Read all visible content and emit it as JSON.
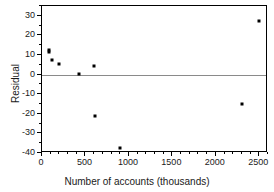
{
  "chart_data": {
    "type": "scatter",
    "title": "",
    "xlabel": "Number of accounts (thousands)",
    "ylabel": "Residual",
    "xlim": [
      0,
      2600
    ],
    "ylim": [
      -40,
      35
    ],
    "grid": false,
    "legend": "none",
    "reference_line": {
      "axis": "y",
      "value": 0
    },
    "xticks": [
      0,
      500,
      1000,
      1500,
      2000,
      2500
    ],
    "xticklabels": [
      "0",
      "500",
      "1000",
      "1500",
      "2000",
      "2500"
    ],
    "yticks": [
      30,
      20,
      10,
      0,
      -10,
      -20,
      -30,
      -40
    ],
    "yticklabels": [
      "30",
      "20",
      "10",
      "0",
      "-10",
      "-20",
      "-30",
      "-40"
    ],
    "points": [
      {
        "x": 80,
        "y": 12.5
      },
      {
        "x": 85,
        "y": 11.5
      },
      {
        "x": 110,
        "y": 7.5
      },
      {
        "x": 190,
        "y": 5.3
      },
      {
        "x": 425,
        "y": 0.3
      },
      {
        "x": 600,
        "y": 4.5
      },
      {
        "x": 605,
        "y": -21.0
      },
      {
        "x": 900,
        "y": -37.5
      },
      {
        "x": 2300,
        "y": -15.0
      },
      {
        "x": 2500,
        "y": 27.5
      }
    ]
  },
  "axes": {
    "x_title": "Number of accounts (thousands)",
    "y_title": "Residual"
  },
  "colors": {
    "point": "#000000",
    "frame": "#000000",
    "zero_line": "#8a8a8a",
    "background": "#ffffff"
  }
}
